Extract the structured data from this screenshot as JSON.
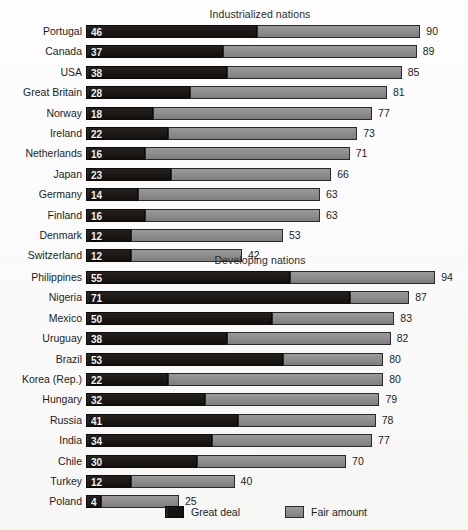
{
  "legend": {
    "great_deal": "Great deal",
    "fair_amount": "Fair amount"
  },
  "colors": {
    "great_deal": "#171310",
    "fair_amount": "#8e8e8e",
    "background": "#ffffff",
    "text": "#1d1d1d"
  },
  "chart_data": {
    "type": "bar",
    "subtype": "stacked-horizontal",
    "title": "",
    "xlabel": "",
    "ylabel": "",
    "xlim": [
      0,
      94
    ],
    "grid": false,
    "legend_position": "bottom",
    "series": [
      {
        "name": "Great deal",
        "color": "#171310"
      },
      {
        "name": "Fair amount",
        "color": "#8e8e8e"
      }
    ],
    "groups": [
      {
        "label": "Industrialized nations",
        "categories": [
          "Portugal",
          "Canada",
          "USA",
          "Great Britain",
          "Norway",
          "Ireland",
          "Netherlands",
          "Japan",
          "Germany",
          "Finland",
          "Denmark",
          "Switzerland"
        ],
        "great_deal": [
          46,
          37,
          38,
          28,
          18,
          22,
          16,
          23,
          14,
          16,
          12,
          12
        ],
        "total": [
          90,
          89,
          85,
          81,
          77,
          73,
          71,
          66,
          63,
          63,
          53,
          42
        ]
      },
      {
        "label": "Developing nations",
        "categories": [
          "Philippines",
          "Nigeria",
          "Mexico",
          "Uruguay",
          "Brazil",
          "Korea (Rep.)",
          "Hungary",
          "Russia",
          "India",
          "Chile",
          "Turkey",
          "Poland"
        ],
        "great_deal": [
          55,
          71,
          50,
          38,
          53,
          22,
          32,
          41,
          34,
          30,
          12,
          4
        ],
        "total": [
          94,
          87,
          83,
          82,
          80,
          80,
          79,
          78,
          77,
          70,
          40,
          25
        ]
      }
    ]
  }
}
